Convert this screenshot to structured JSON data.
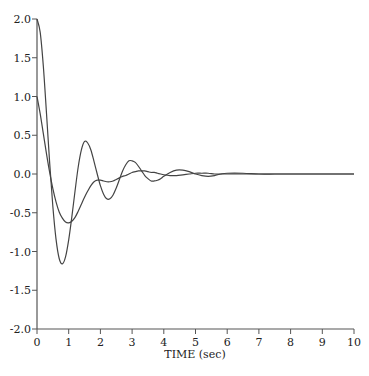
{
  "chart_data": {
    "type": "line",
    "title": "",
    "xlabel": "TIME (sec)",
    "ylabel": "",
    "xlim": [
      0,
      10
    ],
    "ylim": [
      -2.0,
      2.0
    ],
    "grid": false,
    "legend": null,
    "x_ticks": [
      "0",
      "1",
      "2",
      "3",
      "4",
      "5",
      "6",
      "7",
      "8",
      "9",
      "10"
    ],
    "y_ticks": [
      "2.0",
      "1.5",
      "1.0",
      "0.5",
      "0.0",
      "-0.5",
      "-1.0",
      "-1.5",
      "-2.0"
    ],
    "series": [
      {
        "name": "response-1 (initial 2.0)",
        "x": [
          0,
          0.1,
          0.2,
          0.3,
          0.4,
          0.5,
          0.6,
          0.7,
          0.8,
          0.9,
          1.0,
          1.1,
          1.2,
          1.3,
          1.4,
          1.5,
          1.6,
          1.7,
          1.8,
          1.9,
          2.0,
          2.1,
          2.2,
          2.3,
          2.4,
          2.5,
          2.6,
          2.7,
          2.8,
          2.9,
          3.0,
          3.1,
          3.2,
          3.3,
          3.4,
          3.5,
          3.6,
          3.7,
          3.8,
          3.9,
          4.0,
          4.2,
          4.4,
          4.6,
          4.8,
          5.0,
          5.2,
          5.4,
          5.6,
          5.8,
          6.0,
          6.5,
          7.0,
          7.5,
          8.0,
          8.5,
          9.0,
          9.5,
          10.0
        ],
        "values": [
          2.0,
          1.83,
          1.39,
          0.78,
          0.14,
          -0.42,
          -0.84,
          -1.09,
          -1.16,
          -1.07,
          -0.85,
          -0.55,
          -0.22,
          0.09,
          0.31,
          0.42,
          0.4,
          0.31,
          0.16,
          0.0,
          -0.15,
          -0.26,
          -0.32,
          -0.32,
          -0.27,
          -0.18,
          -0.07,
          0.04,
          0.12,
          0.17,
          0.17,
          0.15,
          0.1,
          0.04,
          -0.02,
          -0.06,
          -0.09,
          -0.09,
          -0.08,
          -0.06,
          -0.03,
          0.02,
          0.05,
          0.05,
          0.03,
          0.0,
          -0.02,
          -0.03,
          -0.02,
          0.0,
          0.01,
          0.01,
          0.0,
          0.0,
          0.0,
          0.0,
          0.0,
          0.0,
          0.0
        ]
      },
      {
        "name": "response-2 (initial 1.0)",
        "x": [
          0,
          0.1,
          0.2,
          0.3,
          0.4,
          0.5,
          0.6,
          0.7,
          0.8,
          0.9,
          1.0,
          1.1,
          1.2,
          1.3,
          1.4,
          1.5,
          1.6,
          1.7,
          1.8,
          1.9,
          2.0,
          2.1,
          2.2,
          2.3,
          2.4,
          2.5,
          2.6,
          2.7,
          2.8,
          2.9,
          3.0,
          3.1,
          3.2,
          3.3,
          3.4,
          3.5,
          3.6,
          3.7,
          3.8,
          3.9,
          4.0,
          4.2,
          4.4,
          4.6,
          4.8,
          5.0,
          5.2,
          5.4,
          5.6,
          5.8,
          6.0,
          6.5,
          7.0,
          7.5,
          8.0,
          8.5,
          9.0,
          9.5,
          10.0
        ],
        "values": [
          1.0,
          0.78,
          0.52,
          0.26,
          0.02,
          -0.19,
          -0.36,
          -0.49,
          -0.57,
          -0.62,
          -0.63,
          -0.61,
          -0.56,
          -0.48,
          -0.39,
          -0.3,
          -0.22,
          -0.15,
          -0.1,
          -0.08,
          -0.08,
          -0.09,
          -0.1,
          -0.1,
          -0.09,
          -0.07,
          -0.05,
          -0.03,
          -0.02,
          0.0,
          0.02,
          0.03,
          0.04,
          0.04,
          0.04,
          0.03,
          0.02,
          0.02,
          0.01,
          0.0,
          -0.01,
          -0.02,
          -0.02,
          -0.01,
          0.0,
          0.01,
          0.01,
          0.01,
          0.0,
          0.0,
          0.0,
          0.0,
          0.0,
          0.0,
          0.0,
          0.0,
          0.0,
          0.0,
          0.0
        ]
      }
    ]
  },
  "layout": {
    "plot_left": 37,
    "plot_right": 354,
    "plot_top": 19,
    "plot_bottom": 329,
    "line_color": "#444444",
    "axis_color": "#555555"
  }
}
